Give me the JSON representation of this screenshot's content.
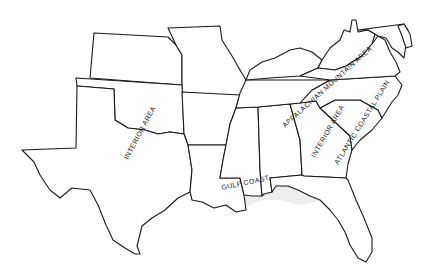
{
  "map": {
    "type": "outline map",
    "region": "Southern United States",
    "colors": {
      "outline": "#1a1a1a",
      "background": "#ffffff",
      "coastal_shading": "#eeeeee"
    },
    "labels": [
      {
        "id": "interior-west",
        "text": "INTERIOR AREA"
      },
      {
        "id": "gulf-coast",
        "text": "GULF COAST"
      },
      {
        "id": "appalachian",
        "text": "APPALACHIAN MOUNTAIN AREA"
      },
      {
        "id": "interior-east",
        "text": "INTERIOR AREA"
      },
      {
        "id": "atlantic",
        "text": "ATLANTIC COASTAL PLAIN"
      }
    ]
  }
}
